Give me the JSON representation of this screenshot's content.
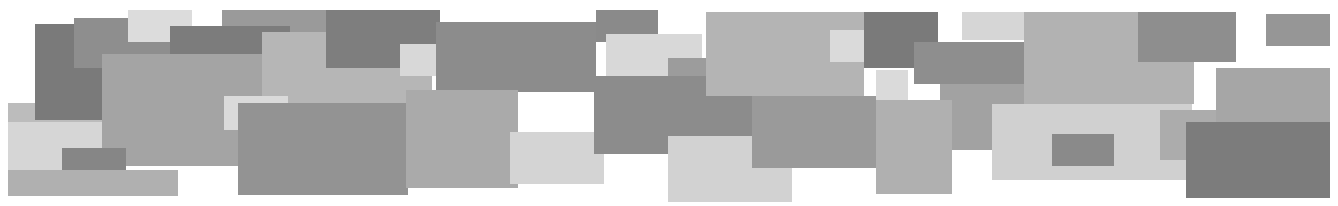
{
  "banner": {
    "background": "#ffffff",
    "rects": [
      {
        "x": 8,
        "y": 103,
        "w": 98,
        "h": 92,
        "c": "#bcbcbc"
      },
      {
        "x": 35,
        "y": 24,
        "w": 68,
        "h": 96,
        "c": "#7a7a7a"
      },
      {
        "x": 74,
        "y": 18,
        "w": 96,
        "h": 50,
        "c": "#8e8e8e"
      },
      {
        "x": 8,
        "y": 122,
        "w": 98,
        "h": 50,
        "c": "#d6d6d6"
      },
      {
        "x": 128,
        "y": 10,
        "w": 64,
        "h": 32,
        "c": "#dcdcdc"
      },
      {
        "x": 222,
        "y": 10,
        "w": 214,
        "h": 46,
        "c": "#9a9a9a"
      },
      {
        "x": 170,
        "y": 26,
        "w": 120,
        "h": 28,
        "c": "#7c7c7c"
      },
      {
        "x": 102,
        "y": 54,
        "w": 160,
        "h": 112,
        "c": "#a4a4a4"
      },
      {
        "x": 62,
        "y": 148,
        "w": 64,
        "h": 32,
        "c": "#868686"
      },
      {
        "x": 8,
        "y": 170,
        "w": 170,
        "h": 26,
        "c": "#b0b0b0"
      },
      {
        "x": 262,
        "y": 32,
        "w": 170,
        "h": 92,
        "c": "#b6b6b6"
      },
      {
        "x": 326,
        "y": 10,
        "w": 114,
        "h": 58,
        "c": "#7e7e7e"
      },
      {
        "x": 400,
        "y": 44,
        "w": 66,
        "h": 32,
        "c": "#d8d8d8"
      },
      {
        "x": 224,
        "y": 96,
        "w": 64,
        "h": 34,
        "c": "#dadada"
      },
      {
        "x": 238,
        "y": 103,
        "w": 170,
        "h": 92,
        "c": "#939393"
      },
      {
        "x": 436,
        "y": 22,
        "w": 160,
        "h": 70,
        "c": "#8c8c8c"
      },
      {
        "x": 406,
        "y": 90,
        "w": 112,
        "h": 98,
        "c": "#aaaaaa"
      },
      {
        "x": 510,
        "y": 132,
        "w": 94,
        "h": 52,
        "c": "#d4d4d4"
      },
      {
        "x": 596,
        "y": 10,
        "w": 62,
        "h": 32,
        "c": "#8a8a8a"
      },
      {
        "x": 606,
        "y": 34,
        "w": 96,
        "h": 42,
        "c": "#d8d8d8"
      },
      {
        "x": 668,
        "y": 58,
        "w": 40,
        "h": 20,
        "c": "#9c9c9c"
      },
      {
        "x": 594,
        "y": 76,
        "w": 158,
        "h": 78,
        "c": "#8c8c8c"
      },
      {
        "x": 668,
        "y": 136,
        "w": 124,
        "h": 66,
        "c": "#d2d2d2"
      },
      {
        "x": 706,
        "y": 12,
        "w": 158,
        "h": 84,
        "c": "#b4b4b4"
      },
      {
        "x": 752,
        "y": 96,
        "w": 124,
        "h": 72,
        "c": "#9a9a9a"
      },
      {
        "x": 830,
        "y": 30,
        "w": 64,
        "h": 32,
        "c": "#dadada"
      },
      {
        "x": 864,
        "y": 12,
        "w": 74,
        "h": 56,
        "c": "#7a7a7a"
      },
      {
        "x": 876,
        "y": 70,
        "w": 32,
        "h": 32,
        "c": "#dadada"
      },
      {
        "x": 914,
        "y": 42,
        "w": 110,
        "h": 42,
        "c": "#8e8e8e"
      },
      {
        "x": 940,
        "y": 84,
        "w": 122,
        "h": 66,
        "c": "#a2a2a2"
      },
      {
        "x": 962,
        "y": 12,
        "w": 64,
        "h": 28,
        "c": "#d6d6d6"
      },
      {
        "x": 876,
        "y": 100,
        "w": 76,
        "h": 94,
        "c": "#b0b0b0"
      },
      {
        "x": 992,
        "y": 104,
        "w": 200,
        "h": 76,
        "c": "#d0d0d0"
      },
      {
        "x": 1024,
        "y": 12,
        "w": 170,
        "h": 92,
        "c": "#b2b2b2"
      },
      {
        "x": 1052,
        "y": 134,
        "w": 62,
        "h": 32,
        "c": "#8a8a8a"
      },
      {
        "x": 1138,
        "y": 12,
        "w": 98,
        "h": 50,
        "c": "#8e8e8e"
      },
      {
        "x": 1160,
        "y": 110,
        "w": 80,
        "h": 50,
        "c": "#acacac"
      },
      {
        "x": 1216,
        "y": 68,
        "w": 114,
        "h": 56,
        "c": "#a6a6a6"
      },
      {
        "x": 1186,
        "y": 122,
        "w": 144,
        "h": 76,
        "c": "#7c7c7c"
      },
      {
        "x": 1266,
        "y": 14,
        "w": 64,
        "h": 32,
        "c": "#969696"
      }
    ]
  }
}
